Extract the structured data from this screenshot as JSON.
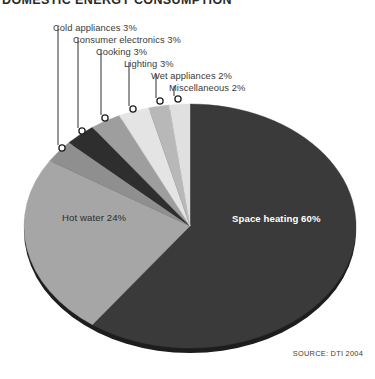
{
  "title": "DOMESTIC ENERGY CONSUMPTION",
  "source": "SOURCE: DTI 2004",
  "chart_data": {
    "type": "pie",
    "title": "DOMESTIC ENERGY CONSUMPTION",
    "unit": "%",
    "total": 100,
    "legend_position": "callout-labels",
    "grid": false,
    "categories": [
      "Space heating",
      "Hot water",
      "Cold appliances",
      "Consumer electronics",
      "Cooking",
      "Lighting",
      "Wet appliances",
      "Miscellaneous"
    ],
    "values": [
      60,
      24,
      3,
      3,
      3,
      3,
      2,
      2
    ],
    "slices": [
      {
        "name": "Space heating",
        "value": 60,
        "label": "Space heating 60%",
        "color": "#3a3a3a",
        "label_style": "inside-light"
      },
      {
        "name": "Hot water",
        "value": 24,
        "label": "Hot water 24%",
        "color": "#a6a6a6",
        "label_style": "inside-dark"
      },
      {
        "name": "Cold appliances",
        "value": 3,
        "label": "Cold appliances 3%",
        "color": "#8f8f8f",
        "label_style": "callout"
      },
      {
        "name": "Consumer electronics",
        "value": 3,
        "label": "Consumer electronics 3%",
        "color": "#2e2e2e",
        "label_style": "callout"
      },
      {
        "name": "Cooking",
        "value": 3,
        "label": "Cooking 3%",
        "color": "#9e9e9e",
        "label_style": "callout"
      },
      {
        "name": "Lighting",
        "value": 3,
        "label": "Lighting 3%",
        "color": "#e4e4e4",
        "label_style": "callout"
      },
      {
        "name": "Wet appliances",
        "value": 2,
        "label": "Wet appliances 2%",
        "color": "#b8b8b8",
        "label_style": "callout"
      },
      {
        "name": "Miscellaneous",
        "value": 2,
        "label": "Miscellaneous 2%",
        "color": "#e0e0e0",
        "label_style": "callout"
      }
    ],
    "callouts": [
      {
        "name": "Cold appliances",
        "label": "Cold appliances 3%",
        "label_x": 53,
        "label_y": 22,
        "line_x": 58,
        "line_y1": 26,
        "line_y2": 145,
        "marker_x": 62,
        "marker_y": 148
      },
      {
        "name": "Consumer electronics",
        "label": "Consumer electronics 3%",
        "label_x": 73,
        "label_y": 34,
        "line_x": 78,
        "line_y1": 38,
        "line_y2": 128,
        "marker_x": 82,
        "marker_y": 131
      },
      {
        "name": "Cooking",
        "label": "Cooking 3%",
        "label_x": 96,
        "label_y": 46,
        "line_x": 101,
        "line_y1": 50,
        "line_y2": 115,
        "marker_x": 105,
        "marker_y": 118
      },
      {
        "name": "Lighting",
        "label": "Lighting 3%",
        "label_x": 124,
        "label_y": 58,
        "line_x": 129,
        "line_y1": 62,
        "line_y2": 106,
        "marker_x": 133,
        "marker_y": 109
      },
      {
        "name": "Wet appliances",
        "label": "Wet appliances 2%",
        "label_x": 151,
        "label_y": 70,
        "line_x": 156,
        "line_y1": 74,
        "line_y2": 98,
        "marker_x": 160,
        "marker_y": 101
      },
      {
        "name": "Miscellaneous",
        "label": "Miscellaneous 2%",
        "label_x": 169,
        "label_y": 82,
        "line_x": 174,
        "line_y1": 86,
        "line_y2": 96,
        "marker_x": 178,
        "marker_y": 99
      }
    ],
    "inside_labels": [
      {
        "name": "Hot water",
        "text": "Hot water 24%",
        "x": 62,
        "y": 221,
        "style": "inside-dark"
      },
      {
        "name": "Space heating",
        "text": "Space heating 60%",
        "x": 232,
        "y": 222,
        "style": "inside-light"
      }
    ],
    "geometry": {
      "center_x": 190,
      "center_y": 226,
      "radius_x": 166,
      "radius_y": 122,
      "start_angle_deg": 0,
      "direction": "clockwise",
      "depth_shadow": true
    }
  }
}
